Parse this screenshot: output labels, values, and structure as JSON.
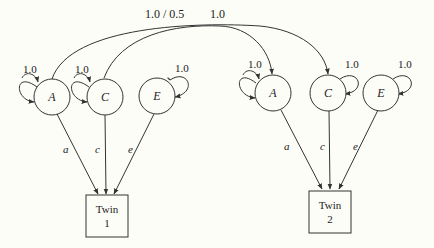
{
  "diagram": {
    "type": "ACE twin model path diagram",
    "colors": {
      "background": "#fdfdf8",
      "stroke": "#333333",
      "text": "#222222"
    },
    "correlations": {
      "A_label": "1.0 / 0.5",
      "C_label": "1.0"
    },
    "twin1": {
      "latents": [
        {
          "id": "A",
          "label": "A",
          "variance": "1.0",
          "path": "a"
        },
        {
          "id": "C",
          "label": "C",
          "variance": "1.0",
          "path": "c"
        },
        {
          "id": "E",
          "label": "E",
          "variance": "1.0",
          "path": "e"
        }
      ],
      "box_line1": "Twin",
      "box_line2": "1"
    },
    "twin2": {
      "latents": [
        {
          "id": "A",
          "label": "A",
          "variance": "1.0",
          "path": "a"
        },
        {
          "id": "C",
          "label": "C",
          "variance": "1.0",
          "path": "c"
        },
        {
          "id": "E",
          "label": "E",
          "variance": "1.0",
          "path": "e"
        }
      ],
      "box_line1": "Twin",
      "box_line2": "2"
    }
  }
}
